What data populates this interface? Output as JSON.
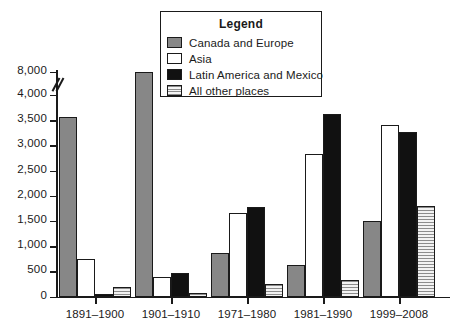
{
  "chart_data": {
    "type": "bar",
    "title": "",
    "xlabel": "",
    "ylabel": "",
    "grid": false,
    "legend_position": "top-center",
    "legend_title": "Legend",
    "axis_break": {
      "between": [
        4000,
        8000
      ],
      "note": "broken y-axis between 4,000 and 8,000"
    },
    "ylim": [
      0,
      8000
    ],
    "ytick_labels": [
      "0",
      "500",
      "1,000",
      "1,500",
      "2,000",
      "2,500",
      "3,000",
      "3,500",
      "4,000",
      "8,000"
    ],
    "ytick_values": [
      0,
      500,
      1000,
      1500,
      2000,
      2500,
      3000,
      3500,
      4000,
      8000
    ],
    "categories": [
      "1891–1900",
      "1901–1910",
      "1971–1980",
      "1981–1990",
      "1999–2008"
    ],
    "series": [
      {
        "name": "Canada and Europe",
        "key": "canada",
        "values": [
          3570,
          8000,
          870,
          620,
          1490
        ]
      },
      {
        "name": "Asia",
        "key": "asia",
        "values": [
          750,
          390,
          1650,
          2820,
          3400
        ]
      },
      {
        "name": "Latin America and Mexico",
        "key": "latin",
        "values": [
          50,
          465,
          1780,
          3620,
          3270
        ]
      },
      {
        "name": "All other places",
        "key": "other",
        "values": [
          180,
          65,
          255,
          330,
          1800
        ]
      }
    ]
  },
  "legend": {
    "title": "Legend",
    "entries": [
      {
        "label": "Canada and Europe",
        "swatch": "canada"
      },
      {
        "label": "Asia",
        "swatch": "asia"
      },
      {
        "label": "Latin America and Mexico",
        "swatch": "latin"
      },
      {
        "label": "All other places",
        "swatch": "other"
      }
    ]
  },
  "colors": {
    "canada": "#878787",
    "asia": "#ffffff",
    "latin": "#111111",
    "other": "#e3e3e3",
    "axis": "#1a1a1a",
    "background": "#ffffff"
  }
}
